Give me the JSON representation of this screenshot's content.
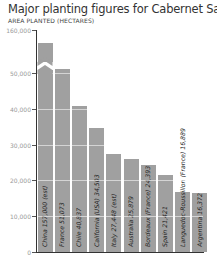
{
  "title": "Major planting figures for Cabernet Sauvignon",
  "subtitle": "AREA PLANTED (HECTARES)",
  "colors": {
    "bar": "#a0a0a0",
    "axis": "#333333",
    "tick_label": "#999999",
    "text": "#333333"
  },
  "y_ticks": [
    "160,000",
    "50,000",
    "40,000",
    "30,000",
    "20,000",
    "10,000",
    "0"
  ],
  "bars": [
    {
      "label": "China 157,000 (est)",
      "value": 157000
    },
    {
      "label": "France 51,073",
      "value": 51073
    },
    {
      "label": "Chile 40,837",
      "value": 40837
    },
    {
      "label": "California (USA) 34,503",
      "value": 34503
    },
    {
      "label": "Italy 27,448 (est)",
      "value": 27448
    },
    {
      "label": "Australia 25,879",
      "value": 25879
    },
    {
      "label": "Bordeaux (France) 24,393",
      "value": 24393
    },
    {
      "label": "Spain 21,421",
      "value": 21421
    },
    {
      "label": "Languedoc-Roussillon (France) 16,889",
      "value": 16889
    },
    {
      "label": "Argentina 16,372",
      "value": 16372
    }
  ],
  "chart_data": {
    "type": "bar",
    "title": "Major planting figures for Cabernet Sauvignon",
    "subtitle": "AREA PLANTED (HECTARES)",
    "xlabel": "",
    "ylabel": "Area planted (hectares)",
    "categories": [
      "China (est)",
      "France",
      "Chile",
      "California (USA)",
      "Italy (est)",
      "Australia",
      "Bordeaux (France)",
      "Spain",
      "Languedoc-Roussillon (France)",
      "Argentina"
    ],
    "values": [
      157000,
      51073,
      40837,
      34503,
      27448,
      25879,
      24393,
      21421,
      16889,
      16372
    ],
    "y_ticks": [
      0,
      10000,
      20000,
      30000,
      40000,
      50000,
      160000
    ],
    "ylim": [
      0,
      160000
    ],
    "axis_break": "between 50,000 and 160,000",
    "grid": false,
    "legend": null
  }
}
